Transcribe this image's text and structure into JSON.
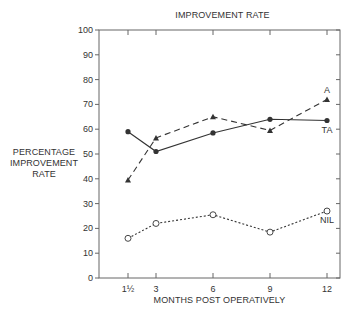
{
  "chart_data": {
    "type": "line",
    "title": "IMPROVEMENT RATE",
    "xlabel": "MONTHS POST OPERATIVELY",
    "ylabel": "PERCENTAGE\nIMPROVEMENT\nRATE",
    "x": [
      1.5,
      3,
      6,
      9,
      12
    ],
    "x_tick_labels": [
      "1½",
      "3",
      "6",
      "9",
      "12"
    ],
    "y_ticks": [
      0,
      10,
      20,
      30,
      40,
      50,
      60,
      70,
      80,
      90,
      100
    ],
    "ylim": [
      0,
      100
    ],
    "grid": false,
    "legend": "inline labels at right end of each series",
    "series": [
      {
        "name": "TA",
        "values": [
          59,
          51,
          58.5,
          64,
          63.5
        ],
        "marker": "filled-circle",
        "line": "solid"
      },
      {
        "name": "A",
        "values": [
          39.5,
          56.5,
          65,
          59.5,
          72
        ],
        "marker": "filled-triangle",
        "line": "dashed"
      },
      {
        "name": "NIL",
        "values": [
          16,
          22,
          25.5,
          18.5,
          27
        ],
        "marker": "open-circle",
        "line": "dotted"
      }
    ]
  },
  "colors": {
    "ink": "#333333",
    "axis": "#666666"
  }
}
